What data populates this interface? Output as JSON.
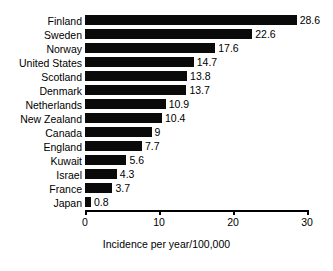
{
  "chart_data": {
    "type": "bar",
    "orientation": "horizontal",
    "title": "",
    "xlabel": "Incidence per year/100,000",
    "ylabel": "",
    "xlim": [
      0,
      30
    ],
    "xticks": [
      "0",
      "10",
      "20",
      "30"
    ],
    "grid": false,
    "legend": null,
    "bar_color": "#0a0a0a",
    "categories": [
      "Finland",
      "Sweden",
      "Norway",
      "United States",
      "Scotland",
      "Denmark",
      "Netherlands",
      "New Zealand",
      "Canada",
      "England",
      "Kuwait",
      "Israel",
      "France",
      "Japan"
    ],
    "values": [
      28.6,
      22.6,
      17.6,
      14.7,
      13.8,
      13.7,
      10.9,
      10.4,
      9,
      7.7,
      5.6,
      4.3,
      3.7,
      0.8
    ],
    "value_labels": [
      "28.6",
      "22.6",
      "17.6",
      "14.7",
      "13.8",
      "13.7",
      "10.9",
      "10.4",
      "9",
      "7.7",
      "5.6",
      "4.3",
      "3.7",
      "0.8"
    ]
  }
}
